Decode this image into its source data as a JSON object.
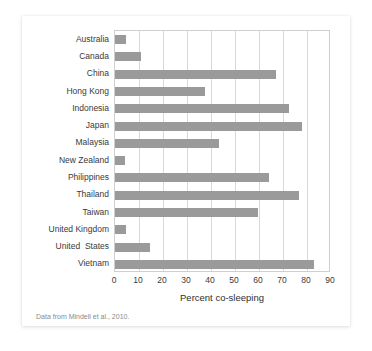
{
  "figure": {
    "source_note": "Data from Mindell et al., 2010."
  },
  "chart_data": {
    "type": "bar",
    "orientation": "horizontal",
    "title": "",
    "xlabel": "Percent co-sleeping",
    "ylabel": "",
    "xlim": [
      0,
      90
    ],
    "xticks": [
      0,
      10,
      20,
      30,
      40,
      50,
      60,
      70,
      80,
      90
    ],
    "xtick_labels": [
      "0",
      "10",
      "20",
      "30",
      "40",
      "50",
      "60",
      "70",
      "80",
      "90"
    ],
    "grid": true,
    "grid_axis": "x",
    "legend": false,
    "bar_color": "#9a9a9a",
    "grid_color": "#d8d8d8",
    "axis_color": "#cfcfcf",
    "categories": [
      "Australia",
      "Canada",
      "China",
      "Hong Kong",
      "Indonesia",
      "Japan",
      "Malaysia",
      "New Zealand",
      "Philippines",
      "Thailand",
      "Taiwan",
      "United Kingdom",
      "United  States",
      "Vietnam"
    ],
    "values": [
      4.5,
      11,
      67,
      37.5,
      72.5,
      78,
      43.5,
      4,
      64,
      76.5,
      59.5,
      4.5,
      14.5,
      83
    ]
  }
}
